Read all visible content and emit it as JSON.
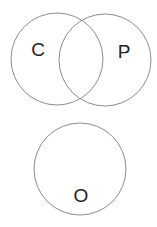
{
  "diagram": {
    "type": "venn",
    "circles": [
      {
        "id": "C",
        "label": "C",
        "cx": 57,
        "cy": 59,
        "r": 46,
        "label_x": 38,
        "label_y": 50
      },
      {
        "id": "P",
        "label": "P",
        "cx": 105,
        "cy": 60,
        "r": 46,
        "label_x": 124,
        "label_y": 52
      },
      {
        "id": "O",
        "label": "O",
        "cx": 80,
        "cy": 169,
        "r": 46,
        "label_x": 81,
        "label_y": 196
      }
    ],
    "overlaps": [
      [
        "C",
        "P"
      ]
    ],
    "stroke_color": "#8c8c8c",
    "label_color": "#222222"
  }
}
